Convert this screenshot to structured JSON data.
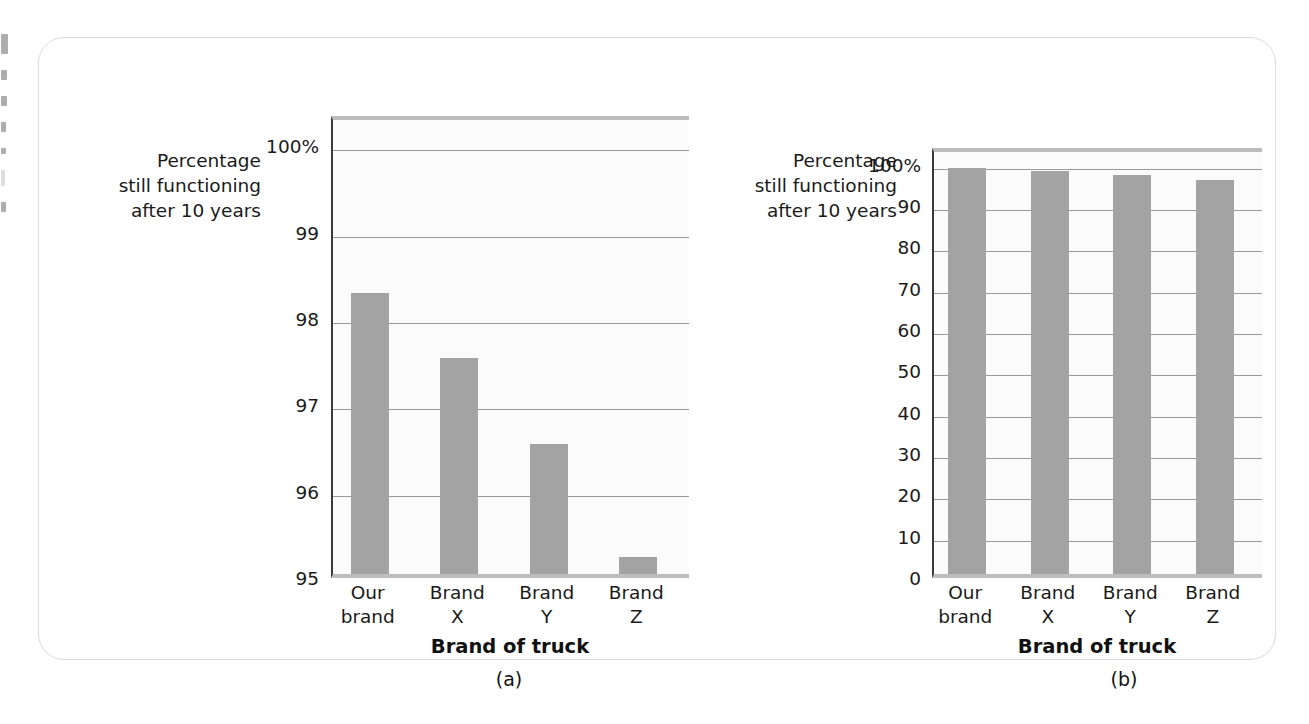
{
  "figure": {
    "panel_a_caption": "(a)",
    "panel_b_caption": "(b)",
    "y_axis_title": "Percentage\nstill functioning\nafter 10 years",
    "x_axis_title": "Brand of truck",
    "bar_color": "#a3a3a3",
    "gridline_color": "#9a9a9a",
    "axis_color": "#3a3a3a",
    "plot_background": "#fbfbfb",
    "frame_border_color": "#dcdcdc"
  },
  "chart_data": [
    {
      "type": "bar",
      "id": "panel-a",
      "title": "",
      "categories": [
        "Our\nbrand",
        "Brand\nX",
        "Brand\nY",
        "Brand\nZ"
      ],
      "values": [
        98.25,
        97.5,
        96.5,
        95.2
      ],
      "xlabel": "Brand of truck",
      "ylabel": "Percentage still functioning after 10 years",
      "ylim": [
        95,
        100.35
      ],
      "yticks": [
        95,
        96,
        97,
        98,
        99,
        100
      ],
      "ytick_labels": [
        "95",
        "96",
        "97",
        "98",
        "99",
        "100%"
      ],
      "grid": true,
      "legend": "none",
      "caption": "(a)"
    },
    {
      "type": "bar",
      "id": "panel-b",
      "title": "",
      "categories": [
        "Our\nbrand",
        "Brand\nX",
        "Brand\nY",
        "Brand\nZ"
      ],
      "values": [
        98.25,
        97.5,
        96.5,
        95.2
      ],
      "xlabel": "Brand of truck",
      "ylabel": "Percentage still functioning after 10 years",
      "ylim": [
        0,
        104
      ],
      "yticks": [
        0,
        10,
        20,
        30,
        40,
        50,
        60,
        70,
        80,
        90,
        100
      ],
      "ytick_labels": [
        "0",
        "10",
        "20",
        "30",
        "40",
        "50",
        "60",
        "70",
        "80",
        "90",
        "100%"
      ],
      "grid": true,
      "legend": "none",
      "caption": "(b)"
    }
  ]
}
